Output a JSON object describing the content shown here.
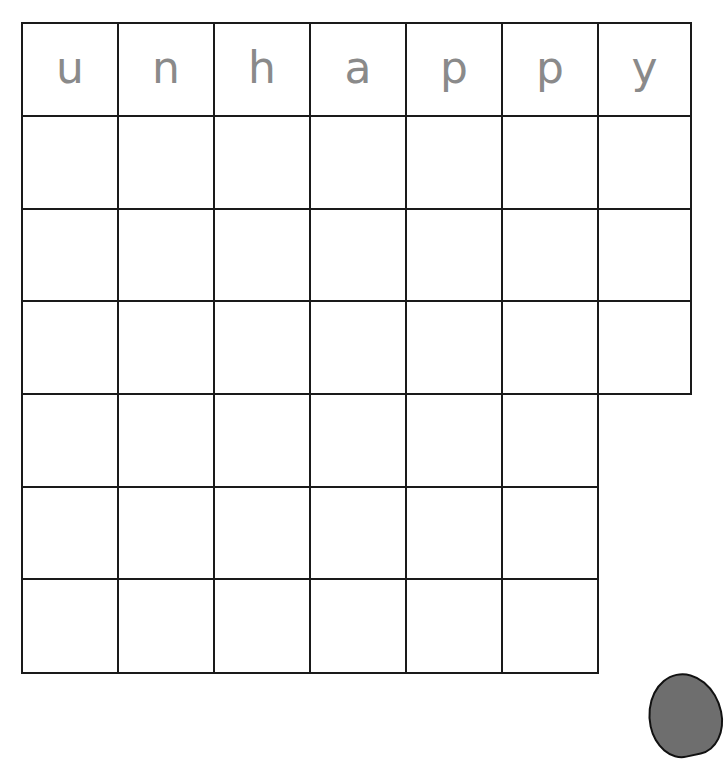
{
  "worksheet": {
    "word": "unhappy",
    "header_letters": [
      "u",
      "n",
      "h",
      "a",
      "p",
      "p",
      "y"
    ],
    "grid": {
      "columns": 7,
      "rows_total": 7,
      "full_width_rows": 4,
      "narrow_rows": 3,
      "narrow_row_columns": 6
    },
    "colors": {
      "line": "#1a1a1a",
      "letter": "#8a8a8a",
      "blob": "#6e6e6e"
    }
  }
}
